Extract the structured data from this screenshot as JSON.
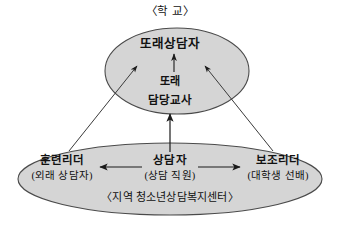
{
  "diagram": {
    "title": "〈학 교〉",
    "background_color": "#ffffff",
    "ellipse_fill": "#d5d5d5",
    "ellipse_stroke": "#4a4a4a",
    "arrow_color": "#1a1a1a",
    "school": {
      "caption": "〈학 교〉",
      "nodes": {
        "peer_counselor": "또래상담자",
        "peer_teacher_line1": "또래",
        "peer_teacher_line2": "담당교사"
      }
    },
    "center": {
      "caption": "〈지역 청소년상담복지센터〉",
      "roles": [
        {
          "name": "훈련리더",
          "detail": "(외래 상담자)"
        },
        {
          "name": "상담자",
          "detail": "(상담 직원)"
        },
        {
          "name": "보조리더",
          "detail": "(대학생 선배)"
        }
      ]
    },
    "connections": [
      {
        "id": "teacher-to-peer-counselor",
        "from": "또래 담당교사",
        "to": "또래상담자",
        "direction": "up"
      },
      {
        "id": "counselor-to-school",
        "from": "상담자",
        "to": "또래 담당교사",
        "direction": "up"
      },
      {
        "id": "trainer-to-peer-counselor",
        "from": "훈련리더",
        "to": "또래상담자",
        "direction": "up-right"
      },
      {
        "id": "assistant-to-peer-counselor",
        "from": "보조리더",
        "to": "또래상담자",
        "direction": "up-left"
      },
      {
        "id": "counselor-to-trainer",
        "from": "상담자",
        "to": "훈련리더",
        "direction": "left"
      },
      {
        "id": "counselor-to-assistant",
        "from": "상담자",
        "to": "보조리더",
        "direction": "right"
      }
    ]
  }
}
